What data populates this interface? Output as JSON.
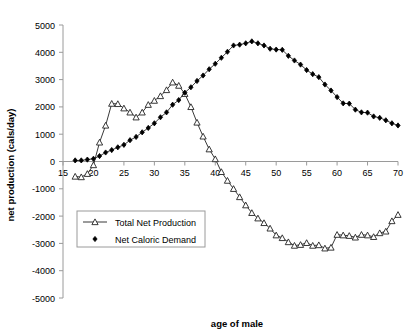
{
  "chart_data": {
    "type": "line",
    "title": "",
    "xlabel": "age of male",
    "ylabel": "net production (cals/day)",
    "xlim": [
      15,
      70
    ],
    "ylim": [
      -5000,
      5000
    ],
    "xticks": [
      15,
      20,
      25,
      30,
      35,
      40,
      45,
      50,
      55,
      60,
      65,
      70
    ],
    "yticks": [
      5000,
      4000,
      3000,
      2000,
      1000,
      0,
      -1000,
      -2000,
      -3000,
      -4000,
      -5000
    ],
    "grid": false,
    "legend_position": "center-left",
    "x": [
      17,
      18,
      19,
      20,
      21,
      22,
      23,
      24,
      25,
      26,
      27,
      28,
      29,
      30,
      31,
      32,
      33,
      34,
      35,
      36,
      37,
      38,
      39,
      40,
      41,
      42,
      43,
      44,
      45,
      46,
      47,
      48,
      49,
      50,
      51,
      52,
      53,
      54,
      55,
      56,
      57,
      58,
      59,
      60,
      61,
      62,
      63,
      64,
      65,
      66,
      67,
      68,
      69,
      70
    ],
    "series": [
      {
        "name": "Total Net Production",
        "marker": "open-triangle",
        "color": "#222222",
        "values": [
          -550,
          -570,
          -450,
          -130,
          700,
          1320,
          2120,
          2110,
          1950,
          1800,
          1620,
          1800,
          2080,
          2230,
          2400,
          2620,
          2900,
          2780,
          2480,
          2000,
          1430,
          920,
          450,
          90,
          -380,
          -700,
          -1000,
          -1300,
          -1600,
          -1880,
          -2080,
          -2250,
          -2450,
          -2700,
          -2800,
          -2950,
          -3080,
          -3050,
          -2980,
          -3080,
          -3060,
          -3180,
          -3150,
          -2680,
          -2700,
          -2720,
          -2780,
          -2680,
          -2700,
          -2760,
          -2620,
          -2560,
          -2180,
          -1950
        ]
      },
      {
        "name": "Net Caloric Demand",
        "marker": "filled-diamond",
        "color": "#000000",
        "values": [
          40,
          40,
          70,
          100,
          200,
          330,
          420,
          520,
          610,
          780,
          900,
          1070,
          1230,
          1400,
          1620,
          1800,
          2080,
          2250,
          2520,
          2720,
          2950,
          3150,
          3380,
          3580,
          3800,
          4020,
          4250,
          4280,
          4330,
          4400,
          4330,
          4250,
          4130,
          4100,
          4090,
          3870,
          3700,
          3550,
          3350,
          3200,
          3090,
          2820,
          2600,
          2360,
          2130,
          2120,
          1900,
          1800,
          1790,
          1650,
          1600,
          1510,
          1400,
          1320
        ]
      }
    ]
  }
}
